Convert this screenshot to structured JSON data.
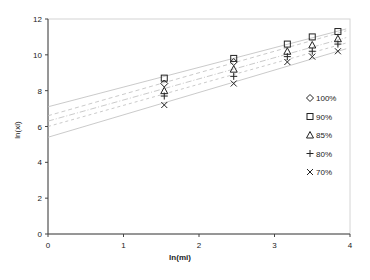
{
  "chart_data": {
    "type": "scatter",
    "title": "",
    "xlabel": "ln(mi)",
    "ylabel": "ln(xi)",
    "xlim": [
      0,
      4
    ],
    "ylim": [
      0,
      12
    ],
    "x_ticks": [
      "0",
      "1",
      "2",
      "3",
      "4"
    ],
    "y_ticks": [
      "0",
      "2",
      "4",
      "6",
      "8",
      "10",
      "12"
    ],
    "grid": false,
    "legend_position": "right-inside",
    "x": [
      1.54,
      2.46,
      3.17,
      3.5,
      3.84
    ],
    "series": [
      {
        "name": "100%",
        "marker": "diamond",
        "values": [
          8.4,
          9.6,
          null,
          null,
          null
        ],
        "trend": [
          7.1,
          1.1
        ]
      },
      {
        "name": "90%",
        "marker": "square",
        "values": [
          8.7,
          9.8,
          10.6,
          11.0,
          11.3
        ],
        "trend": [
          6.6,
          1.2
        ]
      },
      {
        "name": "85%",
        "marker": "triangle",
        "values": [
          8.0,
          9.2,
          10.2,
          10.55,
          10.9
        ],
        "trend": [
          6.3,
          1.18
        ]
      },
      {
        "name": "80%",
        "marker": "plus",
        "values": [
          7.7,
          8.8,
          9.9,
          10.2,
          10.6
        ],
        "trend": [
          6.0,
          1.18
        ]
      },
      {
        "name": "70%",
        "marker": "cross",
        "values": [
          7.2,
          8.4,
          9.6,
          9.9,
          10.2
        ],
        "trend": [
          5.4,
          1.25
        ]
      }
    ]
  },
  "legend": {
    "items": [
      "100%",
      "90%",
      "85%",
      "80%",
      "70%"
    ]
  },
  "axes": {
    "xlabel": "ln(mi)",
    "ylabel": "ln(xi)"
  }
}
